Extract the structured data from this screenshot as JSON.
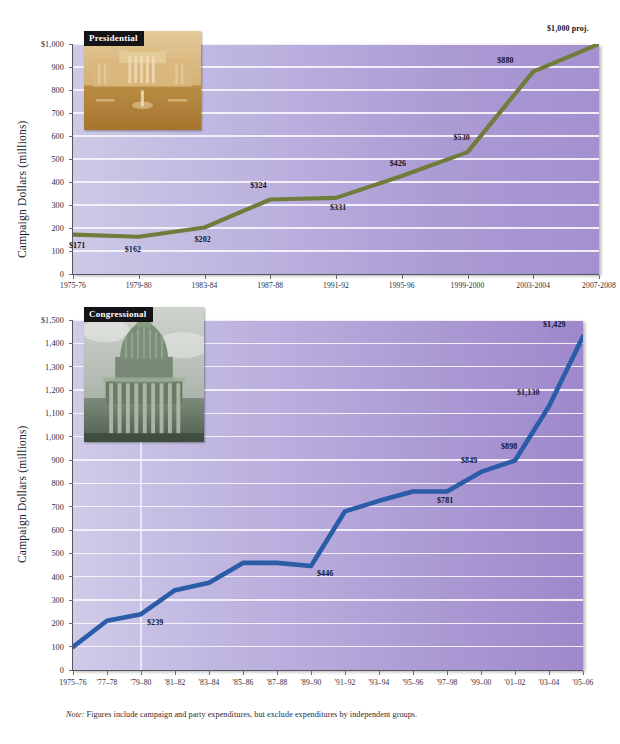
{
  "figure": {
    "note_prefix": "Note:",
    "note": "Figures include campaign and party expenditures, but exclude expenditures by independent groups.",
    "note_full": "Note: Figures include campaign and party expenditures, but exclude expenditures by independent groups."
  },
  "chart_data": [
    {
      "id": "presidential",
      "type": "line",
      "title": "Presidential",
      "badge_label": "Presidential",
      "photo_caption": "white-house-photo",
      "xlabel": "",
      "ylabel": "Campaign Dollars (millions)",
      "ylim": [
        0,
        1000
      ],
      "ytick_labels": [
        "$1,000",
        "900",
        "800",
        "700",
        "600",
        "500",
        "400",
        "300",
        "200",
        "100",
        "0"
      ],
      "ytick_values": [
        1000,
        900,
        800,
        700,
        600,
        500,
        400,
        300,
        200,
        100,
        0
      ],
      "grid": true,
      "legend": "none",
      "line_color": "#6f7c3c",
      "categories": [
        "1975-76",
        "1979-80",
        "1983-84",
        "1987-88",
        "1991-92",
        "1995-96",
        "1999-2000",
        "2003-2004",
        "2007-2008"
      ],
      "values": [
        171,
        162,
        202,
        324,
        331,
        426,
        530,
        880,
        1000
      ],
      "data_labels": [
        "$171",
        "$162",
        "$202",
        "$324",
        "$331",
        "$426",
        "$530",
        "$880",
        "$1,000 proj."
      ],
      "annotations": [
        "$1,000 proj. is a projected figure"
      ]
    },
    {
      "id": "congressional",
      "type": "line",
      "title": "Congressional",
      "badge_label": "Congressional",
      "photo_caption": "us-capitol-photo",
      "xlabel": "",
      "ylabel": "Campaign Dollars (millions)",
      "ylim": [
        0,
        1500
      ],
      "ytick_labels": [
        "$1,500",
        "1,400",
        "1,300",
        "1,200",
        "1,100",
        "1,000",
        "900",
        "800",
        "700",
        "600",
        "500",
        "400",
        "300",
        "200",
        "100",
        "0"
      ],
      "ytick_values": [
        1500,
        1400,
        1300,
        1200,
        1100,
        1000,
        900,
        800,
        700,
        600,
        500,
        400,
        300,
        200,
        100,
        0
      ],
      "grid": true,
      "legend": "none",
      "line_color": "#2a5ca8",
      "categories": [
        "1975–76",
        "'77–78",
        "'79–80",
        "'81–82",
        "'83–84",
        "'85–86",
        "'87–88",
        "'89–90",
        "'91–92",
        "'93–94",
        "'95–96",
        "'97–98",
        "'99–00",
        "'01–02",
        "'03–04",
        "'05–06"
      ],
      "values": [
        99,
        211,
        239,
        342,
        374,
        459,
        459,
        446,
        680,
        725,
        765,
        765,
        849,
        898,
        1130,
        1429
      ],
      "data_labels": [
        "",
        "",
        "$239",
        "",
        "",
        "",
        "",
        "$446",
        "",
        "",
        "",
        "$781",
        "$849",
        "$898",
        "$1,130",
        "$1,429"
      ],
      "labeled_points": [
        {
          "category": "'79–80",
          "label": "$239",
          "value": 239
        },
        {
          "category": "'89–90",
          "label": "$446",
          "value": 446
        },
        {
          "category": "'97–98",
          "label": "$781",
          "value": 781
        },
        {
          "category": "'99–00",
          "label": "$849",
          "value": 849
        },
        {
          "category": "'01–02",
          "label": "$898",
          "value": 898
        },
        {
          "category": "'03–04",
          "label": "$1,130",
          "value": 1130
        },
        {
          "category": "'05–06",
          "label": "$1,429",
          "value": 1429
        }
      ]
    }
  ]
}
